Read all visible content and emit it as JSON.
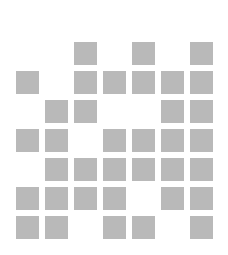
{
  "grid": {
    "rows": 7,
    "cols": 7,
    "cell_size": 23,
    "pitch": 29,
    "origin": [
      16,
      42
    ],
    "fill_color": "#b9b9b9",
    "background": "#ffffff",
    "pattern": [
      [
        0,
        0,
        1,
        0,
        1,
        0,
        1
      ],
      [
        1,
        0,
        1,
        1,
        1,
        1,
        1
      ],
      [
        0,
        1,
        1,
        0,
        0,
        1,
        1
      ],
      [
        1,
        1,
        0,
        1,
        1,
        1,
        1
      ],
      [
        0,
        1,
        1,
        1,
        1,
        1,
        1
      ],
      [
        1,
        1,
        1,
        1,
        0,
        1,
        1
      ],
      [
        1,
        1,
        0,
        1,
        1,
        0,
        1
      ]
    ]
  }
}
